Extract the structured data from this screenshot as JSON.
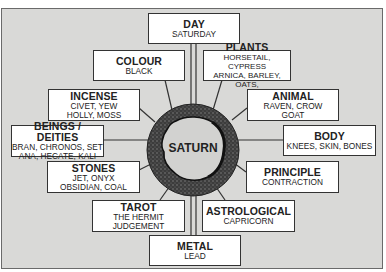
{
  "diagram": {
    "center": "SATURN",
    "colors": {
      "background": "#d9d9d7",
      "box_fill": "#ffffff",
      "ring": "#3a3a3a",
      "border": "#333333"
    },
    "nodes": [
      {
        "id": "day",
        "title": "DAY",
        "lines": [
          "SATURDAY"
        ]
      },
      {
        "id": "colour",
        "title": "COLOUR",
        "lines": [
          "BLACK"
        ]
      },
      {
        "id": "plants",
        "title": "PLANTS",
        "lines": [
          "HORSETAIL, CYPRESS",
          "ARNICA, BARLEY, OATS,"
        ]
      },
      {
        "id": "incense",
        "title": "INCENSE",
        "lines": [
          "CIVET, YEW",
          "HOLLY, MOSS"
        ]
      },
      {
        "id": "animal",
        "title": "ANIMAL",
        "lines": [
          "RAVEN, CROW",
          "GOAT"
        ]
      },
      {
        "id": "beings",
        "title": "BEINGS / DEITIES",
        "lines": [
          "BRAN, CHRONOS, SET",
          "ANA, HECATE, KALI"
        ]
      },
      {
        "id": "body",
        "title": "BODY",
        "lines": [
          "KNEES, SKIN, BONES"
        ]
      },
      {
        "id": "stones",
        "title": "STONES",
        "lines": [
          "JET, ONYX",
          "OBSIDIAN, COAL"
        ]
      },
      {
        "id": "principle",
        "title": "PRINCIPLE",
        "lines": [
          "CONTRACTION"
        ]
      },
      {
        "id": "tarot",
        "title": "TAROT",
        "lines": [
          "THE HERMIT",
          "JUDGEMENT"
        ]
      },
      {
        "id": "astrological",
        "title": "ASTROLOGICAL",
        "lines": [
          "CAPRICORN"
        ]
      },
      {
        "id": "metal",
        "title": "METAL",
        "lines": [
          "LEAD"
        ]
      }
    ]
  }
}
